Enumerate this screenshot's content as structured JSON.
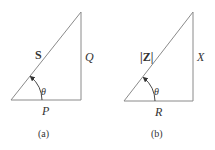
{
  "figures": [
    {
      "id": "a",
      "caption": "(a)",
      "hypotenuse_label": "S",
      "vertical_label": "Q",
      "horizontal_label": "P",
      "angle_label": "θ"
    },
    {
      "id": "b",
      "caption": "(b)",
      "hypotenuse_label": "|Z|",
      "vertical_label": "X",
      "horizontal_label": "R",
      "angle_label": "θ"
    }
  ],
  "colors": {
    "line": "#8a8a8a",
    "text": "#333333"
  }
}
